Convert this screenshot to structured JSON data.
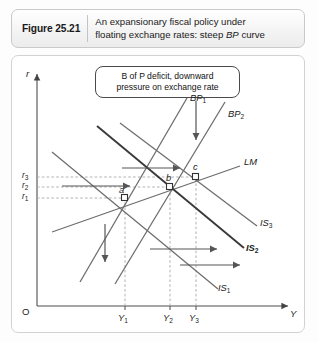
{
  "figure": {
    "number_label": "Figure 25.21",
    "caption_line1": "An expansionary fiscal policy under",
    "caption_line2_pre": "floating exchange rates: steep ",
    "caption_line2_em": "BP",
    "caption_line2_post": " curve"
  },
  "annotation": {
    "line1": "B of P deficit, downward",
    "line2": "pressure on exchange rate"
  },
  "axes": {
    "y_axis_label": "r",
    "x_axis_label": "Y",
    "origin_label": "O",
    "y_ticks": [
      {
        "label": "r",
        "sub": "3"
      },
      {
        "label": "r",
        "sub": "2"
      },
      {
        "label": "r",
        "sub": "1"
      }
    ],
    "x_ticks": [
      {
        "label": "Y",
        "sub": "1"
      },
      {
        "label": "Y",
        "sub": "2"
      },
      {
        "label": "Y",
        "sub": "3"
      }
    ]
  },
  "curves": [
    {
      "name": "BP1",
      "label": "BP",
      "sub": "1",
      "kind": "bp"
    },
    {
      "name": "BP2",
      "label": "BP",
      "sub": "2",
      "kind": "bp"
    },
    {
      "name": "LM",
      "label": "LM",
      "sub": "",
      "kind": "lm"
    },
    {
      "name": "IS3",
      "label": "IS",
      "sub": "3",
      "kind": "is"
    },
    {
      "name": "IS2",
      "label": "IS",
      "sub": "2",
      "kind": "is"
    },
    {
      "name": "IS1",
      "label": "IS",
      "sub": "1",
      "kind": "is"
    }
  ],
  "equilibrium_points": [
    {
      "name": "a",
      "label": "a"
    },
    {
      "name": "b",
      "label": "b"
    },
    {
      "name": "c",
      "label": "c"
    }
  ],
  "colors": {
    "frame_border": "#d2d2d2",
    "curve_line": "#6e6e6e",
    "highlight_line": "#3a3a3a",
    "axis": "#5a5a5a",
    "guide_dash": "#a9a9a9",
    "text": "#1b1b1b"
  }
}
